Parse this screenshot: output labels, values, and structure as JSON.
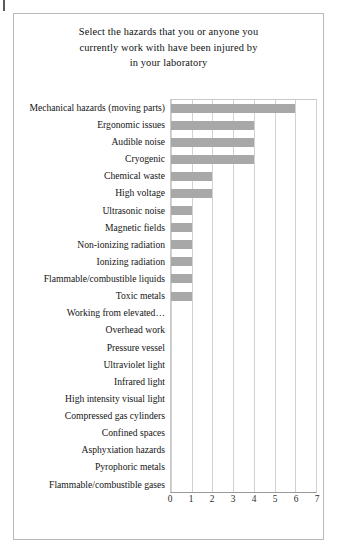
{
  "chart_data": {
    "type": "bar",
    "orientation": "horizontal",
    "title": "Select the hazards that you or anyone you currently work with have been injured by in your laboratory",
    "title_lines": [
      "Select the hazards that you or anyone you",
      "currently work with have been injured by",
      "in your laboratory"
    ],
    "xlabel": "",
    "ylabel": "",
    "xlim": [
      0,
      7
    ],
    "xticks": [
      0,
      1,
      2,
      3,
      4,
      5,
      6,
      7
    ],
    "xtick_labels": [
      "0",
      "1",
      "2",
      "3",
      "4",
      "5",
      "6",
      "7"
    ],
    "grid": true,
    "legend": false,
    "bar_color": "#a8a8a8",
    "categories": [
      "Mechanical hazards (moving parts)",
      "Ergonomic issues",
      "Audible noise",
      "Cryogenic",
      "Chemical waste",
      "High voltage",
      "Ultrasonic noise",
      "Magnetic fields",
      "Non-ionizing radiation",
      "Ionizing radiation",
      "Flammable/combustible liquids",
      "Toxic metals",
      "Working from elevated…",
      "Overhead work",
      "Pressure vessel",
      "Ultraviolet light",
      "Infrared light",
      "High intensity visual light",
      "Compressed gas cylinders",
      "Confined spaces",
      "Asphyxiation hazards",
      "Pyrophoric metals",
      "Flammable/combustible gases"
    ],
    "values": [
      6,
      4,
      4,
      4,
      2,
      2,
      1,
      1,
      1,
      1,
      1,
      1,
      0,
      0,
      0,
      0,
      0,
      0,
      0,
      0,
      0,
      0,
      0
    ]
  }
}
